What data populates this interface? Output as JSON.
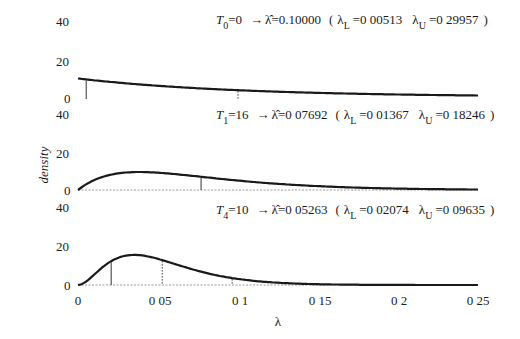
{
  "chart_data": {
    "type": "line",
    "title": "",
    "xlabel": "λ",
    "ylabel": "density",
    "xlim": [
      0,
      0.25
    ],
    "x_ticks": [
      "0",
      "0 05",
      "0 1",
      "0 15",
      "0 2",
      "0 25"
    ],
    "x_tick_values": [
      0,
      0.05,
      0.1,
      0.15,
      0.2,
      0.25
    ],
    "grid": false,
    "legend": null,
    "panels": [
      {
        "name": "T0",
        "ylim": [
          0,
          40
        ],
        "y_ticks": [
          "0",
          "20",
          "40"
        ],
        "annotation": {
          "T_label": "T",
          "T_sub": "0",
          "T_value": "=0",
          "arrow": "→",
          "lambda_hat": "λ̂",
          "lambda_hat_value": "=0.10000",
          "open": "(",
          "lambda_L": "λ",
          "L_sub": "L",
          "lambda_L_value": "=0 00513",
          "lambda_U": "λ",
          "U_sub": "U",
          "lambda_U_value": "=0 29957",
          "close": ")"
        },
        "lambda_hat": 0.1,
        "lambda_L": 0.00513,
        "lambda_U": 0.29957,
        "distribution": {
          "shape": 1,
          "rate": 10
        },
        "x": [
          0,
          0.025,
          0.05,
          0.075,
          0.1,
          0.125,
          0.15,
          0.175,
          0.2,
          0.225,
          0.25
        ],
        "y": [
          10.0,
          7.79,
          6.07,
          4.72,
          3.68,
          2.87,
          2.23,
          1.74,
          1.35,
          1.05,
          0.82
        ]
      },
      {
        "name": "T1",
        "ylim": [
          0,
          40
        ],
        "y_ticks": [
          "0",
          "20",
          "40"
        ],
        "annotation": {
          "T_label": "T",
          "T_sub": "1",
          "T_value": "=16",
          "arrow": "→",
          "lambda_hat": "λ̂",
          "lambda_hat_value": "=0 07692",
          "open": "(",
          "lambda_L": "λ",
          "L_sub": "L",
          "lambda_L_value": "=0 01367",
          "lambda_U": "λ",
          "U_sub": "U",
          "lambda_U_value": "=0 18246",
          "close": ")"
        },
        "lambda_hat": 0.07692,
        "lambda_L": 0.01367,
        "lambda_U": 0.18246,
        "distribution": {
          "shape": 2,
          "rate": 26
        },
        "x": [
          0,
          0.025,
          0.05,
          0.075,
          0.1,
          0.125,
          0.15,
          0.175,
          0.2,
          0.225,
          0.25
        ],
        "y": [
          0.0,
          8.85,
          9.2,
          7.18,
          4.98,
          3.24,
          2.02,
          1.22,
          0.72,
          0.42,
          0.24
        ]
      },
      {
        "name": "T4",
        "ylim": [
          0,
          40
        ],
        "y_ticks": [
          "0",
          "20",
          "40"
        ],
        "annotation": {
          "T_label": "T",
          "T_sub": "4",
          "T_value": "=10",
          "arrow": "→",
          "lambda_hat": "λ̂",
          "lambda_hat_value": "=0 05263",
          "open": "(",
          "lambda_L": "λ",
          "L_sub": "L",
          "lambda_L_value": "=0 02074",
          "lambda_U": "λ",
          "U_sub": "U",
          "lambda_U_value": "=0 09635",
          "close": ")"
        },
        "lambda_hat": 0.05263,
        "lambda_L": 0.02074,
        "lambda_U": 0.09635,
        "distribution": {
          "shape": 3,
          "rate": 57
        },
        "x": [
          0,
          0.0125,
          0.025,
          0.0375,
          0.05,
          0.0625,
          0.075,
          0.0875,
          0.1,
          0.125,
          0.15,
          0.175,
          0.2,
          0.25
        ],
        "y": [
          0.0,
          5.1,
          13.7,
          19.0,
          19.5,
          17.0,
          13.3,
          9.6,
          6.5,
          2.7,
          1.0,
          0.35,
          0.12,
          0.01
        ]
      }
    ]
  }
}
